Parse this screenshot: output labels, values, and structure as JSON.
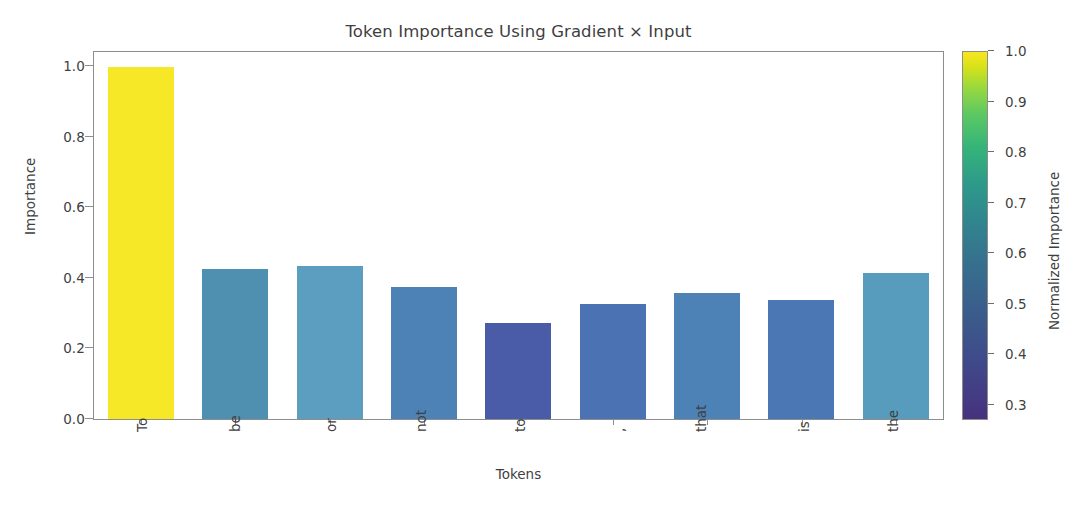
{
  "chart_data": {
    "type": "bar",
    "title": "Token Importance Using Gradient × Input",
    "xlabel": "Tokens",
    "ylabel": "Importance",
    "categories": [
      "To",
      "be",
      "or",
      "not",
      "to",
      ",",
      "that",
      "is",
      "the"
    ],
    "values": [
      0.997,
      0.425,
      0.435,
      0.375,
      0.272,
      0.325,
      0.357,
      0.338,
      0.415
    ],
    "bar_colors": [
      "#f6e826",
      "#4f8fb0",
      "#5b9ec0",
      "#4d82b6",
      "#4a5ba8",
      "#4b73b4",
      "#4d82b6",
      "#4b78b4",
      "#579cbd"
    ],
    "ylim": [
      0.0,
      1.04
    ],
    "ytick_labels": [
      "0.0",
      "0.2",
      "0.4",
      "0.6",
      "0.8",
      "1.0"
    ],
    "ytick_values": [
      0.0,
      0.2,
      0.4,
      0.6,
      0.8,
      1.0
    ],
    "grid": false,
    "colormap": "viridis",
    "colorbar": {
      "label": "Normalized Importance",
      "position": "right",
      "vmin": 0.27,
      "vmax": 1.0,
      "tick_labels": [
        "0.3",
        "0.4",
        "0.5",
        "0.6",
        "0.7",
        "0.8",
        "0.9",
        "1.0"
      ],
      "tick_values": [
        0.3,
        0.4,
        0.5,
        0.6,
        0.7,
        0.8,
        0.9,
        1.0
      ]
    },
    "normalized_values": [
      1.0,
      0.452,
      0.465,
      0.398,
      0.27,
      0.343,
      0.378,
      0.358,
      0.443
    ],
    "xtick_rotation": 90
  }
}
